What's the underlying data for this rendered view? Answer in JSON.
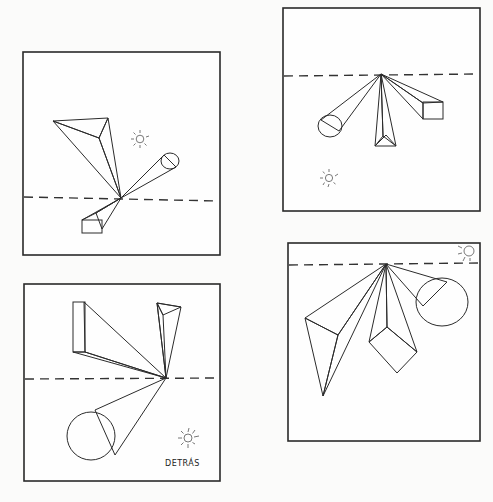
{
  "page": {
    "title": ""
  },
  "panels": [
    {
      "id": "top-left",
      "horizon_label": "horizon line",
      "objects": [
        "triangular prism",
        "cylinder",
        "rectangular prism"
      ],
      "light_icon": "sun-icon",
      "label": ""
    },
    {
      "id": "top-right",
      "horizon_label": "horizon line",
      "objects": [
        "cylinder",
        "triangular prism",
        "rectangular prism"
      ],
      "light_icon": "sun-icon",
      "label": ""
    },
    {
      "id": "bottom-left",
      "horizon_label": "horizon line",
      "objects": [
        "rectangular prism",
        "triangular prism",
        "cylinder"
      ],
      "light_icon": "sun-icon",
      "label": "DETRÁS"
    },
    {
      "id": "bottom-right",
      "horizon_label": "horizon line",
      "objects": [
        "triangular prism",
        "rectangular prism",
        "cylinder"
      ],
      "light_icon": "sun-icon",
      "label": ""
    }
  ],
  "colors": {
    "paper": "#fbfbfa",
    "ink": "#2a2a2a",
    "shade_dark": "#6e6e6e",
    "shade_mid": "#a8a8a8",
    "shade_light": "#d6d6d6"
  }
}
